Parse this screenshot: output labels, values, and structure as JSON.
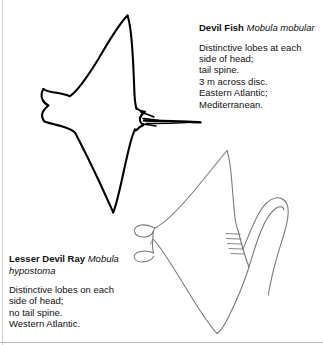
{
  "page": {
    "background_color": "#ffffff",
    "rule_color": "#cfcfcf"
  },
  "species": [
    {
      "id": "devil-fish",
      "common_name": "Devil Fish",
      "genus": "Mobula",
      "species_epithet": "mobular",
      "description_lines": [
        "Distinctive lobes at each",
        "side of head;",
        "tail spine.",
        "3 m across disc.",
        "Eastern Atlantic;",
        "Mediterranean."
      ],
      "illustration": {
        "name": "devil-fish-illustration",
        "stroke_color": "#000000",
        "stroke_weight": "heavy",
        "has_tail_spine": true
      }
    },
    {
      "id": "lesser-devil-ray",
      "common_name": "Lesser Devil Ray",
      "genus": "Mobula",
      "species_epithet": "hypostoma",
      "description_lines": [
        "Distinctive lobes on each",
        "side of head;",
        "no tail spine.",
        "Western Atlantic."
      ],
      "illustration": {
        "name": "lesser-devil-ray-illustration",
        "stroke_color": "#7a7a7f",
        "stroke_weight": "thin",
        "has_tail_spine": false
      }
    }
  ]
}
